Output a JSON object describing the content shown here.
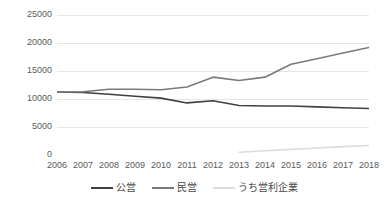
{
  "chart_data": {
    "type": "line",
    "title": "",
    "subtitle": "",
    "xlabel": "",
    "ylabel": "",
    "categories": [
      "2006",
      "2007",
      "2008",
      "2009",
      "2010",
      "2011",
      "2012",
      "2013",
      "2014",
      "2015",
      "2016",
      "2017",
      "2018"
    ],
    "x": [
      2006,
      2007,
      2008,
      2009,
      2010,
      2011,
      2012,
      2013,
      2014,
      2015,
      2016,
      2017,
      2018
    ],
    "ylim": [
      0,
      25000
    ],
    "xlim": [
      2006,
      2018
    ],
    "yticks": [
      0,
      5000,
      10000,
      15000,
      20000,
      25000
    ],
    "ytick_labels": [
      "0",
      "5000",
      "10000",
      "15000",
      "20000",
      "25000"
    ],
    "grid": true,
    "grid_axis": "y",
    "legend_position": "bottom",
    "series": [
      {
        "name": "公営",
        "color": "#404040",
        "values": [
          11250,
          11150,
          10850,
          10500,
          10150,
          9300,
          9700,
          8850,
          8750,
          8750,
          8600,
          8450,
          8300
        ]
      },
      {
        "name": "民営",
        "color": "#7a7a7a",
        "values": [
          11250,
          11300,
          11750,
          11750,
          11650,
          12150,
          13900,
          13300,
          13900,
          16200,
          17200,
          18200,
          19200
        ]
      },
      {
        "name": "うち営利企業",
        "color": "#dcdcdc",
        "values": [
          null,
          null,
          null,
          null,
          null,
          null,
          null,
          500,
          750,
          1000,
          1250,
          1500,
          1700
        ]
      }
    ]
  },
  "legend": {
    "items": [
      {
        "label": "公営",
        "color": "#404040"
      },
      {
        "label": "民営",
        "color": "#7a7a7a"
      },
      {
        "label": "うち営利企業",
        "color": "#dcdcdc"
      }
    ]
  },
  "axes": {
    "y_tick_labels": [
      "25000",
      "20000",
      "15000",
      "10000",
      "5000",
      "0"
    ],
    "x_tick_labels": [
      "2006",
      "2007",
      "2008",
      "2009",
      "2010",
      "2011",
      "2012",
      "2013",
      "2014",
      "2015",
      "2016",
      "2017",
      "2018"
    ]
  },
  "colors": {
    "background": "#ffffff",
    "gridline": "#e6e6e6",
    "axis_line": "#d0d0d0",
    "tick_text": "#5a5a5a",
    "legend_text": "#494949"
  }
}
